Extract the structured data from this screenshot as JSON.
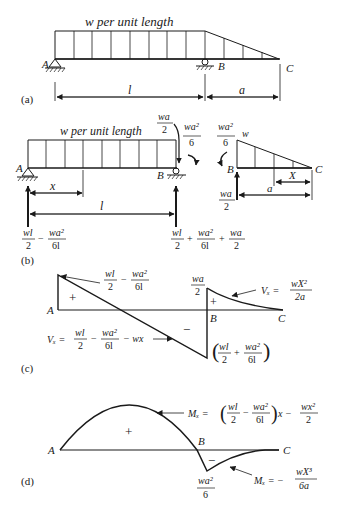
{
  "panels": {
    "a": {
      "label": "(a)",
      "load_label": "w per unit length",
      "points": {
        "A": "A",
        "B": "B",
        "C": "C"
      },
      "dims": {
        "span": "l",
        "overhang": "a"
      }
    },
    "b": {
      "label": "(b)",
      "load_label": "w per unit length",
      "points": {
        "A": "A",
        "B": "B",
        "B2": "B",
        "C": "C",
        "w": "w"
      },
      "dims": {
        "x": "x",
        "span": "l",
        "a": "a",
        "X": "X"
      },
      "shear_at_B": {
        "num": "wa",
        "den": "2"
      },
      "moment_at_B": {
        "num": "wa²",
        "den": "6"
      },
      "moment_at_B2": {
        "num": "wa²",
        "den": "6"
      },
      "reaction_B2": {
        "num": "wa",
        "den": "2"
      },
      "reaction_A": {
        "t1_num": "wl",
        "t1_den": "2",
        "op": "−",
        "t2_num": "wa²",
        "t2_den": "6l"
      },
      "reaction_B": {
        "t1_num": "wl",
        "t1_den": "2",
        "op1": "+",
        "t2_num": "wa²",
        "t2_den": "6l",
        "op2": "+",
        "t3_num": "wa",
        "t3_den": "2"
      }
    },
    "c": {
      "label": "(c)",
      "points": {
        "A": "A",
        "B": "B",
        "C": "C"
      },
      "plus": "+",
      "minus": "−",
      "plus2": "+",
      "top_value": {
        "t1_num": "wl",
        "t1_den": "2",
        "op": "−",
        "t2_num": "wa²",
        "t2_den": "6l"
      },
      "b_value": {
        "num": "wa",
        "den": "2"
      },
      "vx_left": {
        "lhs": "Vₓ =",
        "t1_num": "wl",
        "t1_den": "2",
        "op1": "−",
        "t2_num": "wa²",
        "t2_den": "6l",
        "op2": "− wx"
      },
      "vx_right": {
        "lhs": "Vₓ =",
        "num": "wX²",
        "den": "2a"
      },
      "min_value": {
        "t1_num": "wl",
        "t1_den": "2",
        "op": "+",
        "t2_num": "wa²",
        "t2_den": "6l"
      }
    },
    "d": {
      "label": "(d)",
      "points": {
        "A": "A",
        "B": "B",
        "C": "C"
      },
      "plus": "+",
      "minus": "−",
      "mx_left": {
        "lhs": "Mₓ =",
        "t1_num": "wl",
        "t1_den": "2",
        "op1": "−",
        "t2_num": "wa²",
        "t2_den": "6l",
        "mid": "x −",
        "t3_num": "wx²",
        "t3_den": "2"
      },
      "mx_right": {
        "lhs": "Mₓ = −",
        "num": "wX³",
        "den": "6a"
      },
      "min_value": {
        "num": "wa²",
        "den": "6"
      }
    }
  }
}
